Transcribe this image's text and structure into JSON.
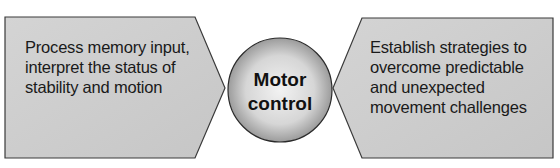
{
  "diagram": {
    "left_box": {
      "text_lines": [
        "Process memory input,",
        "interpret the status of",
        "stability and motion"
      ]
    },
    "center": {
      "text_lines": [
        "Motor",
        "control"
      ]
    },
    "right_box": {
      "text_lines": [
        "Establish strategies to",
        "overcome predictable",
        "and unexpected",
        "movement challenges"
      ]
    },
    "colors": {
      "box_fill": "#cfcfcf",
      "outline": "#3a3a3a",
      "circle_light": "#f2f2f2",
      "circle_dark": "#8a8a8a"
    }
  }
}
